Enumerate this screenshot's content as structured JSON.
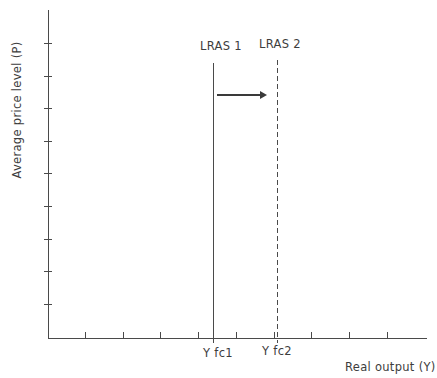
{
  "figure": {
    "background": "#ffffff",
    "line_color": "#4a4a4a",
    "text_color": "#3d3d3d"
  },
  "chart_data": {
    "type": "line",
    "title": "",
    "xlabel": "Real output (Y)",
    "ylabel": "Average price level (P)",
    "axis_numeric_labels": false,
    "grid": false,
    "legend": "none",
    "x_tick_labels": [
      "Y fc1",
      "Y fc2"
    ],
    "unlabeled_x_tick_count": 9,
    "unlabeled_y_tick_count": 9,
    "series": [
      {
        "name": "LRAS 1",
        "shape": "vertical-line",
        "style": "solid",
        "x_label": "Y fc1"
      },
      {
        "name": "LRAS 2",
        "shape": "vertical-line",
        "style": "dashed",
        "x_label": "Y fc2"
      }
    ],
    "annotations": [
      {
        "type": "arrow",
        "direction": "right",
        "from_series": "LRAS 1",
        "to_series": "LRAS 2"
      }
    ]
  }
}
